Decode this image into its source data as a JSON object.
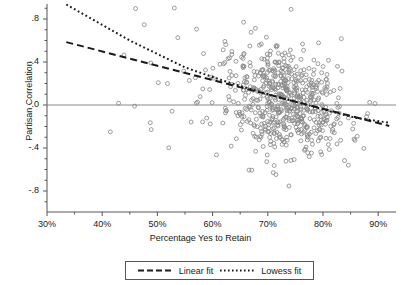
{
  "chart_data": {
    "type": "scatter",
    "title": "",
    "xlabel": "Percentage Yes to Retain",
    "ylabel": "Partisan Correlation",
    "xlim": [
      30,
      95
    ],
    "ylim": [
      -1.0,
      1.0
    ],
    "grid": false,
    "xticks": [
      "30%",
      "40%",
      "50%",
      "60%",
      "70%",
      "80%",
      "90%"
    ],
    "xtick_values": [
      30,
      40,
      50,
      60,
      70,
      80,
      90
    ],
    "yticks": [
      ".8",
      ".4",
      ".0",
      "-.4",
      "-.8"
    ],
    "ytick_values": [
      0.8,
      0.4,
      0.0,
      -0.4,
      -0.8
    ],
    "minor_ticks": true,
    "reference_line": {
      "name": "zero-line",
      "y": 0.0,
      "color": "#888888"
    },
    "marker": {
      "shape": "open-circle",
      "color": "#8a8a8a",
      "size": 4
    },
    "point_count": 640,
    "series": [
      {
        "name": "Linear fit",
        "type": "line",
        "style": "dashed",
        "color": "#1a1a1a",
        "x": [
          33.5,
          92.0
        ],
        "y": [
          0.585,
          -0.195
        ]
      },
      {
        "name": "Lowess fit",
        "type": "line",
        "style": "dotted",
        "color": "#1a1a1a",
        "x": [
          33.5,
          45.0,
          55.0,
          62.0,
          68.0,
          74.0,
          80.0,
          86.0,
          92.0
        ],
        "y": [
          0.935,
          0.6,
          0.35,
          0.225,
          0.13,
          0.045,
          -0.04,
          -0.12,
          -0.165
        ]
      }
    ],
    "legend": {
      "position": "bottom-center",
      "boxed": true,
      "entries": [
        {
          "label": "Linear fit",
          "style": "dashed"
        },
        {
          "label": "Lowess fit",
          "style": "dotted"
        }
      ]
    },
    "scatter_distribution": {
      "x_center": 73.5,
      "x_spread": 7.2,
      "x_min": 33.5,
      "x_max": 93.0,
      "y_center_at_x_center": 0.02,
      "slope": -0.0133,
      "residual_spread": 0.235,
      "y_min": -0.78,
      "y_max": 0.94
    }
  }
}
